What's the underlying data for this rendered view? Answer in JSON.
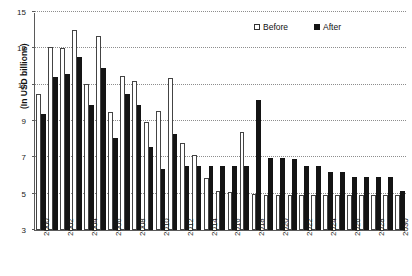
{
  "chart_data": {
    "type": "bar",
    "title": "",
    "xlabel": "",
    "ylabel": "(In USD billions)",
    "ylim": [
      3,
      15
    ],
    "ytick_values": [
      3,
      5,
      7,
      9,
      11,
      13,
      15
    ],
    "ytick_labels": [
      "3",
      "5",
      "7",
      "9",
      "11",
      "13",
      "15"
    ],
    "grid": true,
    "grid_axis": "y",
    "legend_position": "top-right",
    "categories": [
      "2000",
      "2001",
      "2002",
      "2003",
      "2004",
      "2005",
      "2006",
      "2007",
      "2008",
      "2009",
      "2010",
      "2011",
      "2012",
      "2013",
      "2014",
      "2015",
      "2016",
      "2017",
      "2018",
      "2019",
      "2020",
      "2021",
      "2022",
      "2023",
      "2024",
      "2025",
      "2026",
      "2027",
      "2028",
      "2029",
      "2030"
    ],
    "xtick_labels": [
      "2000",
      "2002",
      "2004",
      "2006",
      "2008",
      "2010",
      "2012",
      "2014",
      "2016",
      "2018",
      "2020",
      "2022",
      "2024",
      "2026",
      "2028",
      "2030"
    ],
    "series": [
      {
        "name": "Before",
        "color": "#ffffff",
        "edge_color": "#444444",
        "values": [
          10.5,
          13.1,
          13.0,
          14.0,
          11.05,
          13.7,
          9.5,
          11.5,
          11.2,
          8.95,
          9.55,
          11.35,
          7.8,
          7.15,
          5.85,
          5.15,
          5.1,
          8.4,
          5.0,
          4.95,
          4.95,
          4.95,
          4.95,
          4.95,
          4.95,
          4.95,
          4.95,
          4.95,
          4.95,
          4.95,
          4.95
        ]
      },
      {
        "name": "After",
        "color": "#141414",
        "edge_color": "#141414",
        "values": [
          9.4,
          11.4,
          11.6,
          12.5,
          9.9,
          11.9,
          8.05,
          10.5,
          9.9,
          7.55,
          6.35,
          8.3,
          6.55,
          6.55,
          6.55,
          6.55,
          6.55,
          6.55,
          10.15,
          6.95,
          6.95,
          6.9,
          6.55,
          6.55,
          6.2,
          6.2,
          5.9,
          5.9,
          5.9,
          5.9,
          5.15
        ]
      }
    ]
  },
  "legend": {
    "before_label": "Before",
    "after_label": "After"
  },
  "axes": {
    "y_axis_title": "(In USD billions)"
  }
}
